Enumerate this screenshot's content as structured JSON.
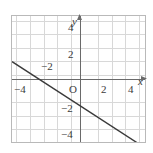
{
  "chart_data": {
    "type": "line",
    "title": "",
    "xlabel": "x",
    "ylabel": "y",
    "xlim": [
      -5,
      5
    ],
    "ylim": [
      -4.75,
      4.75
    ],
    "grid": true,
    "grid_step": 1,
    "legend": "none",
    "origin_label": "O",
    "series": [
      {
        "name": "line",
        "slope": -0.65,
        "intercept": -2,
        "points": [
          [
            -5,
            1.25
          ],
          [
            5,
            -5.25
          ]
        ],
        "color": "#3a3a3a"
      }
    ],
    "x_ticks": [
      {
        "value": -4,
        "label": "−4"
      },
      {
        "value": -2,
        "label": "−2"
      },
      {
        "value": 2,
        "label": "2"
      },
      {
        "value": 4,
        "label": "4"
      }
    ],
    "y_ticks": [
      {
        "value": 4,
        "label": "4"
      },
      {
        "value": 2,
        "label": "2"
      },
      {
        "value": -2,
        "label": "−2"
      },
      {
        "value": -4,
        "label": "−4"
      }
    ]
  },
  "figure": {
    "axis_color": "#6a6a6a",
    "grid_color": "#d8d8d8",
    "border_color": "#b9b9b9",
    "line_color": "#3a3a3a",
    "background": "#ffffff"
  },
  "labels": {
    "x_axis_name": "x",
    "y_axis_name": "y",
    "origin": "O",
    "x_neg4": "−4",
    "x_neg2": "−2",
    "x_pos2": "2",
    "x_pos4": "4",
    "y_pos4": "4",
    "y_pos2": "2",
    "y_neg2": "−2",
    "y_neg4": "−4"
  }
}
